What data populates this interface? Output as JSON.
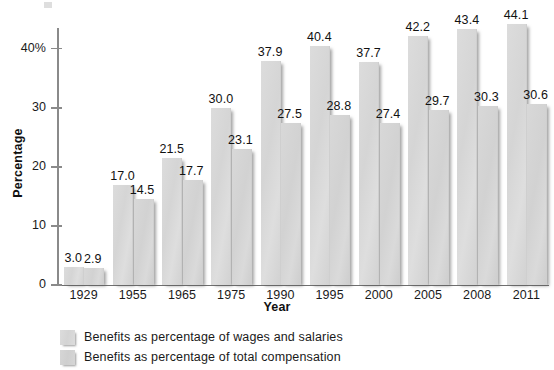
{
  "chart_data": {
    "type": "bar",
    "title": "",
    "xlabel": "Year",
    "ylabel": "Percentage",
    "categories": [
      "1929",
      "1955",
      "1965",
      "1975",
      "1990",
      "1995",
      "2000",
      "2005",
      "2008",
      "2011"
    ],
    "series": [
      {
        "name": "Benefits as percentage of wages and salaries",
        "values": [
          3.0,
          17.0,
          21.5,
          30.0,
          37.9,
          40.4,
          37.7,
          42.2,
          43.4,
          44.1
        ],
        "labels": [
          "3.0",
          "17.0",
          "21.5",
          "30.0",
          "37.9",
          "40.4",
          "37.7",
          "42.2",
          "43.4",
          "44.1"
        ]
      },
      {
        "name": "Benefits as percentage of total compensation",
        "values": [
          2.9,
          14.5,
          17.7,
          23.1,
          27.5,
          28.8,
          27.4,
          29.7,
          30.3,
          30.6
        ],
        "labels": [
          "2.9",
          "14.5",
          "17.7",
          "23.1",
          "27.5",
          "28.8",
          "27.4",
          "29.7",
          "30.3",
          "30.6"
        ]
      }
    ],
    "ylim": [
      0,
      43.5
    ],
    "yticks": [
      0,
      10,
      20,
      30,
      40
    ],
    "ytick_labels": [
      "0",
      "10",
      "20",
      "30",
      "40%"
    ],
    "grid": false,
    "legend_position": "bottom-left",
    "bar_color": "#d6d6d6"
  },
  "axes": {
    "y_title": "Percentage",
    "x_title": "Year"
  },
  "legend": {
    "items": [
      {
        "label": "Benefits as percentage of wages and salaries"
      },
      {
        "label": "Benefits as percentage of total compensation"
      }
    ]
  }
}
